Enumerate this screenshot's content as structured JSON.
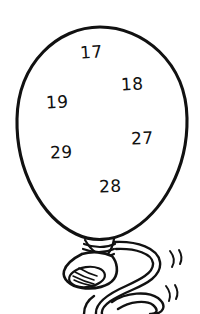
{
  "image": {
    "title": "Balloon with numbers",
    "subject": "balloon-line-drawing",
    "style": "black-and-white coloring page line art",
    "width": 200,
    "height": 314,
    "background_color": "#ffffff",
    "ink_color": "#111111"
  },
  "balloon": {
    "name": "balloon",
    "outline_color": "#111111",
    "fill_color": "#ffffff",
    "parts": [
      {
        "name": "balloon-body",
        "shape": "oval"
      },
      {
        "name": "balloon-neck",
        "shape": "ribbed collar"
      },
      {
        "name": "balloon-nozzle",
        "shape": "flared opening"
      },
      {
        "name": "balloon-string",
        "shape": "curly double-line ribbon"
      },
      {
        "name": "motion-marks",
        "shape": "short curved flick lines"
      }
    ]
  },
  "numbers": [
    {
      "id": "num-17",
      "value": "17"
    },
    {
      "id": "num-18",
      "value": "18"
    },
    {
      "id": "num-19",
      "value": "19"
    },
    {
      "id": "num-27",
      "value": "27"
    },
    {
      "id": "num-29",
      "value": "29"
    },
    {
      "id": "num-28",
      "value": "28"
    }
  ]
}
